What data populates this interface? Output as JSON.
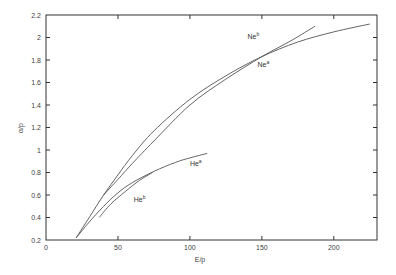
{
  "chart_data": {
    "type": "line",
    "title": "",
    "xlabel": "E/p",
    "ylabel": "α/p",
    "xlim": [
      0,
      230
    ],
    "ylim": [
      0.2,
      2.2
    ],
    "xticks": [
      0,
      50,
      100,
      150,
      200
    ],
    "xtick_labels": [
      "0",
      "50",
      "100",
      "150",
      "200"
    ],
    "yticks": [
      0.2,
      0.4,
      0.6,
      0.8,
      1.0,
      1.2,
      1.4,
      1.6,
      1.8,
      2.0,
      2.2
    ],
    "ytick_labels": [
      "0.2",
      "0.4",
      "0.6",
      "0.8",
      "1",
      "1.2",
      "1.4",
      "1.6",
      "1.8",
      "2",
      "2.2"
    ],
    "grid": false,
    "legend": "inline labels",
    "series": [
      {
        "name": "Ne^a",
        "label_base": "Ne",
        "label_sup": "a",
        "label_pos": [
          147,
          1.74
        ],
        "x": [
          21,
          30,
          40,
          50,
          60,
          75,
          100,
          125,
          150,
          175,
          200,
          225
        ],
        "y": [
          0.22,
          0.4,
          0.6,
          0.78,
          0.95,
          1.17,
          1.45,
          1.66,
          1.83,
          1.96,
          2.05,
          2.12
        ]
      },
      {
        "name": "Ne^b",
        "label_base": "Ne",
        "label_sup": "b",
        "label_pos": [
          140,
          1.99
        ],
        "x": [
          40,
          50,
          60,
          75,
          100,
          125,
          150,
          170,
          187
        ],
        "y": [
          0.6,
          0.74,
          0.88,
          1.08,
          1.4,
          1.63,
          1.83,
          1.97,
          2.1
        ]
      },
      {
        "name": "He^a",
        "label_base": "He",
        "label_sup": "a",
        "label_pos": [
          100,
          0.86
        ],
        "x": [
          21,
          30,
          40,
          50,
          60,
          75,
          90,
          100,
          112
        ],
        "y": [
          0.22,
          0.36,
          0.5,
          0.62,
          0.71,
          0.81,
          0.89,
          0.93,
          0.97
        ]
      },
      {
        "name": "He^b",
        "label_base": "He",
        "label_sup": "b",
        "label_pos": [
          61,
          0.54
        ],
        "x": [
          37,
          45,
          55,
          65,
          74
        ],
        "y": [
          0.4,
          0.52,
          0.63,
          0.73,
          0.8
        ]
      }
    ]
  }
}
